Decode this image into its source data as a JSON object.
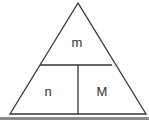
{
  "diagram": {
    "type": "formula-triangle",
    "labels": {
      "top": "m",
      "bottom_left": "n",
      "bottom_right": "M"
    },
    "colors": {
      "line": "#333333",
      "text": "#333333",
      "background": "#ffffff",
      "bottom_bar": "#8a8a8a"
    }
  }
}
